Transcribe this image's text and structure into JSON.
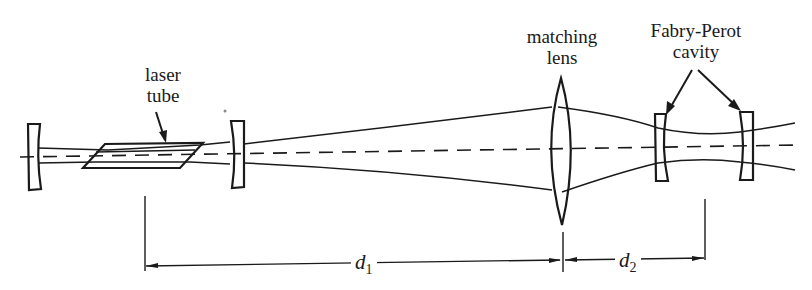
{
  "diagram": {
    "type": "optical-setup",
    "labels": {
      "laser_tube": [
        "laser",
        "tube"
      ],
      "matching_lens": [
        "matching",
        "lens"
      ],
      "fabry_perot": [
        "Fabry-Perot",
        "cavity"
      ]
    },
    "dimensions": {
      "d1": {
        "symbol": "d",
        "subscript": "1"
      },
      "d2": {
        "symbol": "d",
        "subscript": "2"
      }
    },
    "colors": {
      "ink": "#1a1a1a",
      "background": "#ffffff"
    }
  }
}
